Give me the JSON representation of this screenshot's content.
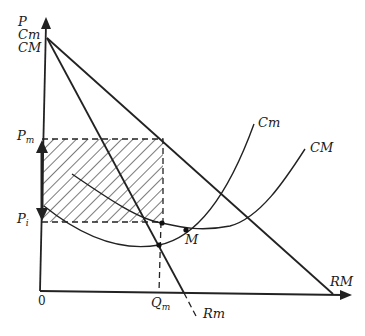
{
  "diagram": {
    "axes": {
      "y_label_lines": [
        "P",
        "Cm",
        "CM"
      ],
      "origin_label": "0"
    },
    "price_labels": {
      "pm": {
        "main": "P",
        "sub": "m"
      },
      "pi": {
        "main": "P",
        "sub": "i"
      }
    },
    "quantity_label": {
      "main": "Q",
      "sub": "m"
    },
    "curves": {
      "marginal_cost": "Cm",
      "average_cost": "CM",
      "average_revenue": "RM",
      "marginal_revenue": "Rm"
    },
    "points": {
      "m": "M"
    },
    "shaded_region": "monopoly-profit-area"
  }
}
